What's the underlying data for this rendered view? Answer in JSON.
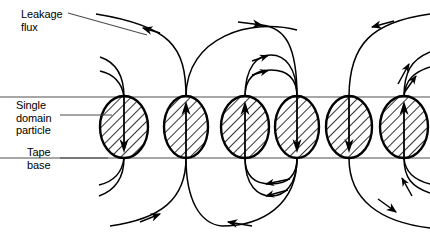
{
  "figure": {
    "background_color": "#ffffff",
    "stroke_color": "#000000",
    "tape_line_color": "#8a8a8a"
  },
  "labels": {
    "leakage_flux": "Leakage\nflux",
    "single_domain_particle": "Single\ndomain\nparticle",
    "tape_base": "Tape\nbase"
  },
  "tape": {
    "top_line_y": 97,
    "bottom_line_y": 158,
    "left_x": 0,
    "right_x": 430
  },
  "particles": [
    {
      "id": "particle-1",
      "cx": 124,
      "cy": 127,
      "rx": 24,
      "ry": 31,
      "magnetization": "down"
    },
    {
      "id": "particle-2",
      "cx": 186,
      "cy": 127,
      "rx": 22,
      "ry": 31,
      "magnetization": "up"
    },
    {
      "id": "particle-3",
      "cx": 245,
      "cy": 127,
      "rx": 24,
      "ry": 31,
      "magnetization": "up"
    },
    {
      "id": "particle-4",
      "cx": 297,
      "cy": 127,
      "rx": 22,
      "ry": 31,
      "magnetization": "down"
    },
    {
      "id": "particle-5",
      "cx": 349,
      "cy": 127,
      "rx": 23,
      "ry": 31,
      "magnetization": "down"
    },
    {
      "id": "particle-6",
      "cx": 404,
      "cy": 127,
      "rx": 24,
      "ry": 31,
      "magnetization": "up"
    }
  ],
  "leader_lines": {
    "leakage_flux": {
      "x1": 68,
      "y1": 13,
      "x2": 147,
      "y2": 35
    },
    "single_domain_particle": {
      "x1": 60,
      "y1": 115,
      "x2": 112,
      "y2": 115
    },
    "tape_base": {
      "x1": 60,
      "y1": 158,
      "x2": 108,
      "y2": 158
    }
  },
  "field_lines": {
    "above_tape_count": 9,
    "below_tape_count": 9,
    "arrow_marker": "arrowhead"
  }
}
